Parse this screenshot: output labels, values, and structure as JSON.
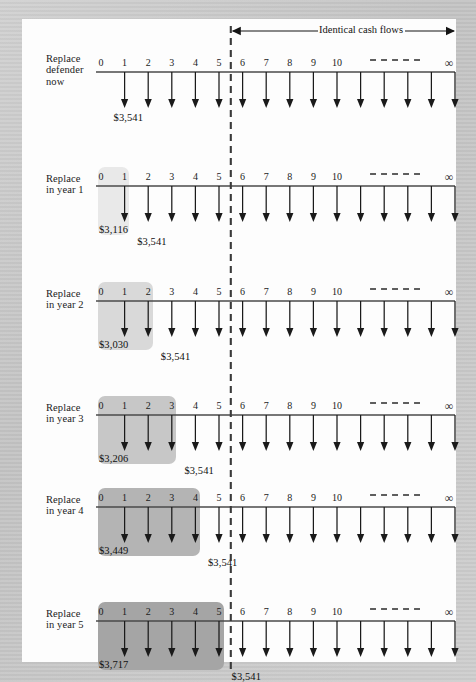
{
  "figure": {
    "type": "cash-flow-timeline-diagram",
    "header_label": "Identical cash flows",
    "infinity_symbol": "∞",
    "dashed_divider_at_period": 5.5,
    "tick_labels": [
      "0",
      "1",
      "2",
      "3",
      "4",
      "5",
      "6",
      "7",
      "8",
      "9",
      "10"
    ],
    "continuation_dashes": true,
    "colors": {
      "page": "#fdfdfd",
      "backdrop": "#c9c9c9",
      "axis": "#4a4a4a",
      "arrow": "#1a1a1a",
      "divider": "#3a3a3a",
      "highlight_year1": "#e9e9e9",
      "highlight_year2": "#d9d9d9",
      "highlight_year3": "#c7c7c7",
      "highlight_year4": "#b4b4b4",
      "highlight_year5": "#a5a5a5"
    }
  },
  "rows": [
    {
      "id": "replace-defender-now",
      "label": "Replace\ndefender\nnow",
      "label_lines": [
        "Replace",
        "defender",
        "now"
      ],
      "highlight": null,
      "defender_amount": null,
      "defender_amount_at": null,
      "challenger_amount": "$3,541",
      "challenger_amount_at": 1,
      "arrows_from": 1
    },
    {
      "id": "replace-in-year-1",
      "label": "Replace\nin year 1",
      "label_lines": [
        "Replace",
        "in year 1"
      ],
      "highlight": {
        "from": 0,
        "to": 1,
        "shade": "#e9e9e9"
      },
      "defender_amount": "$3,116",
      "defender_amount_at": 1,
      "challenger_amount": "$3,541",
      "challenger_amount_at": 2,
      "arrows_from": 1
    },
    {
      "id": "replace-in-year-2",
      "label": "Replace\nin year 2",
      "label_lines": [
        "Replace",
        "in year 2"
      ],
      "highlight": {
        "from": 0,
        "to": 2,
        "shade": "#d9d9d9"
      },
      "defender_amount": "$3,030",
      "defender_amount_at": 1,
      "challenger_amount": "$3,541",
      "challenger_amount_at": 3,
      "arrows_from": 1
    },
    {
      "id": "replace-in-year-3",
      "label": "Replace\nin year 3",
      "label_lines": [
        "Replace",
        "in year 3"
      ],
      "highlight": {
        "from": 0,
        "to": 3,
        "shade": "#c7c7c7"
      },
      "defender_amount": "$3,206",
      "defender_amount_at": 1,
      "challenger_amount": "$3,541",
      "challenger_amount_at": 4,
      "arrows_from": 1
    },
    {
      "id": "replace-in-year-4",
      "label": "Replace\nin year 4",
      "label_lines": [
        "Replace",
        "in year 4"
      ],
      "highlight": {
        "from": 0,
        "to": 4,
        "shade": "#b4b4b4"
      },
      "defender_amount": "$3,449",
      "defender_amount_at": 1,
      "challenger_amount": "$3,541",
      "challenger_amount_at": 5,
      "arrows_from": 1
    },
    {
      "id": "replace-in-year-5",
      "label": "Replace\nin year 5",
      "label_lines": [
        "Replace",
        "in year 5"
      ],
      "highlight": {
        "from": 0,
        "to": 5,
        "shade": "#a5a5a5"
      },
      "defender_amount": "$3,717",
      "defender_amount_at": 1,
      "challenger_amount": "$3,541",
      "challenger_amount_at": 6,
      "arrows_from": 1
    }
  ],
  "chart_data": {
    "type": "line",
    "xlabel": "Period (years)",
    "ylabel": "Cash outflow ($)",
    "annotations": [
      "Identical cash flows"
    ],
    "x": [
      0,
      1,
      2,
      3,
      4,
      5,
      6,
      7,
      8,
      9,
      10
    ],
    "series": [
      {
        "name": "Replace defender now",
        "defender_cost": null,
        "challenger_annual": 3541
      },
      {
        "name": "Replace in year 1",
        "defender_cost": 3116,
        "challenger_annual": 3541
      },
      {
        "name": "Replace in year 2",
        "defender_cost": 3030,
        "challenger_annual": 3541
      },
      {
        "name": "Replace in year 3",
        "defender_cost": 3206,
        "challenger_annual": 3541
      },
      {
        "name": "Replace in year 4",
        "defender_cost": 3449,
        "challenger_annual": 3541
      },
      {
        "name": "Replace in year 5",
        "defender_cost": 3717,
        "challenger_annual": 3541
      }
    ]
  }
}
